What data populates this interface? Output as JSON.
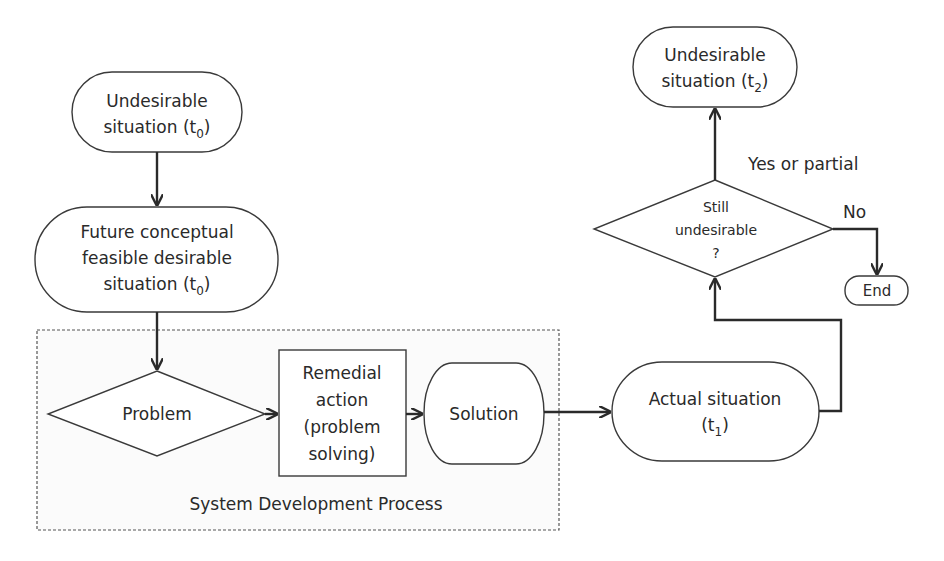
{
  "diagram": {
    "container": {
      "label": "System Development Process"
    },
    "nodes": {
      "undesirable_t0": {
        "lines": [
          "Undesirable",
          "situation (t"
        ],
        "sub": "0",
        "tail": ")"
      },
      "future": {
        "lines": [
          "Future conceptual",
          "feasible desirable",
          "situation (t"
        ],
        "sub": "0",
        "tail": ")"
      },
      "problem": {
        "label": "Problem"
      },
      "remedial": {
        "lines": [
          "Remedial",
          "action",
          "(problem",
          "solving)"
        ]
      },
      "solution": {
        "label": "Solution"
      },
      "actual": {
        "line1": "Actual situation",
        "line2_pre": "(t",
        "sub": "1",
        "tail": ")"
      },
      "decision": {
        "lines": [
          "Still",
          "undesirable",
          "?"
        ]
      },
      "undesirable_t2": {
        "lines": [
          "Undesirable",
          "situation (t"
        ],
        "sub": "2",
        "tail": ")"
      },
      "end": {
        "label": "End"
      }
    },
    "edge_labels": {
      "yes": "Yes or partial",
      "no": "No"
    }
  }
}
